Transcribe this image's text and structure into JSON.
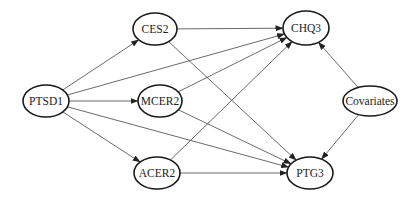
{
  "diagram": {
    "type": "path-model",
    "nodes": [
      {
        "id": "PTSD1",
        "label": "PTSD1",
        "cx": 46,
        "cy": 101,
        "rx": 23,
        "ry": 16
      },
      {
        "id": "CES2",
        "label": "CES2",
        "cx": 155,
        "cy": 29,
        "rx": 22,
        "ry": 16
      },
      {
        "id": "MCER2",
        "label": "MCER2",
        "cx": 160,
        "cy": 101,
        "rx": 22,
        "ry": 16
      },
      {
        "id": "ACER2",
        "label": "ACER2",
        "cx": 157,
        "cy": 173,
        "rx": 23,
        "ry": 16
      },
      {
        "id": "CHQ3",
        "label": "CHQ3",
        "cx": 306,
        "cy": 28,
        "rx": 23,
        "ry": 17
      },
      {
        "id": "Covariates",
        "label": "Covariates",
        "cx": 370,
        "cy": 101,
        "rx": 27,
        "ry": 15
      },
      {
        "id": "PTG3",
        "label": "PTG3",
        "cx": 310,
        "cy": 173,
        "rx": 23,
        "ry": 16
      }
    ],
    "edges": [
      {
        "from": "PTSD1",
        "to": "CES2"
      },
      {
        "from": "PTSD1",
        "to": "MCER2"
      },
      {
        "from": "PTSD1",
        "to": "ACER2"
      },
      {
        "from": "PTSD1",
        "to": "CHQ3"
      },
      {
        "from": "PTSD1",
        "to": "PTG3"
      },
      {
        "from": "CES2",
        "to": "CHQ3"
      },
      {
        "from": "CES2",
        "to": "PTG3"
      },
      {
        "from": "MCER2",
        "to": "CHQ3"
      },
      {
        "from": "MCER2",
        "to": "PTG3"
      },
      {
        "from": "ACER2",
        "to": "CHQ3"
      },
      {
        "from": "ACER2",
        "to": "PTG3"
      },
      {
        "from": "Covariates",
        "to": "CHQ3"
      },
      {
        "from": "Covariates",
        "to": "PTG3"
      }
    ],
    "colors": {
      "node_stroke": "#1a1a1a",
      "edge_stroke": "#444444",
      "arrowhead": "#222222",
      "background": "#ffffff"
    }
  }
}
